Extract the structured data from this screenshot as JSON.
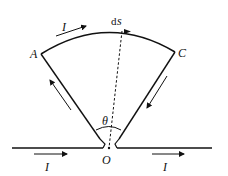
{
  "diagram": {
    "labels": {
      "A": "A",
      "C": "C",
      "O": "O",
      "theta": "θ",
      "ds_d": "d",
      "ds_s": "s",
      "current_top": "I",
      "current_left": "I",
      "current_right": "I"
    },
    "colors": {
      "stroke": "#111111",
      "background": "#ffffff"
    }
  }
}
